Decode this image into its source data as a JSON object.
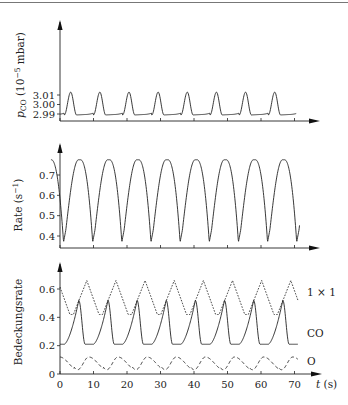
{
  "chart_data": [
    {
      "type": "line",
      "panel": "top",
      "title": "",
      "ylabel": "p_CO (10^-5 mbar)",
      "ylabel_parts": {
        "main": "p",
        "sub": "CO",
        "unit_pre": " (10",
        "sup": "−5",
        "unit_post": " mbar)"
      },
      "xlabel": "",
      "yticks": [
        2.99,
        3.0,
        3.01
      ],
      "ytick_labels": [
        "2.99",
        "3.00",
        "3.01"
      ],
      "ylim": [
        2.986,
        3.025
      ],
      "xlim": [
        0,
        77
      ],
      "grid": false,
      "series": [
        {
          "name": "p_CO",
          "style": "solid",
          "period": 8.7,
          "phase_peak": 3.2,
          "min": 2.989,
          "max": 3.013,
          "t_start": 0.0,
          "t_end": 70.5,
          "shape": "pressure"
        }
      ]
    },
    {
      "type": "line",
      "panel": "middle",
      "ylabel": "Rate (s^-1)",
      "ylabel_parts": {
        "main": "Rate (s",
        "sup": "−1",
        "post": ")"
      },
      "xlabel": "",
      "yticks": [
        0.4,
        0.5,
        0.6,
        0.7
      ],
      "ytick_labels": [
        "0.4",
        "0.5",
        "0.6",
        "0.7"
      ],
      "ylim": [
        0.34,
        0.8
      ],
      "xlim": [
        0,
        77
      ],
      "grid": false,
      "series": [
        {
          "name": "Rate",
          "style": "solid",
          "period": 8.7,
          "phase_peak": 6.1,
          "min": 0.37,
          "max": 0.775,
          "t_start": -2.7,
          "t_end": 71.5,
          "shape": "rate"
        }
      ]
    },
    {
      "type": "line",
      "panel": "bottom",
      "ylabel": "Bedeckungsrate",
      "xlabel": "t (s)",
      "xticks": [
        0,
        10,
        20,
        30,
        40,
        50,
        60,
        70
      ],
      "xtick_labels": [
        "0",
        "10",
        "20",
        "30",
        "40",
        "50",
        "60",
        "70"
      ],
      "yticks": [
        0,
        0.2,
        0.4,
        0.6
      ],
      "ytick_labels": [
        "0",
        "0.2",
        "0.4",
        "0.6"
      ],
      "ylim": [
        0,
        0.72
      ],
      "xlim": [
        0,
        77
      ],
      "grid": false,
      "legend_position": "right-inline",
      "series": [
        {
          "name": "1 × 1",
          "style": "dotted",
          "period": 8.7,
          "phase_peak": 8.0,
          "min": 0.42,
          "max": 0.66,
          "t_start": 0.0,
          "t_end": 71.0,
          "shape": "surface"
        },
        {
          "name": "CO",
          "style": "solid",
          "period": 8.7,
          "phase_peak": 5.6,
          "min": 0.21,
          "max": 0.52,
          "t_start": 0.0,
          "t_end": 71.0,
          "shape": "co"
        },
        {
          "name": "O",
          "style": "dashed",
          "period": 8.7,
          "phase_peak": 8.6,
          "min": 0.03,
          "max": 0.12,
          "t_start": 0.0,
          "t_end": 71.0,
          "shape": "oxygen"
        }
      ],
      "labels": {
        "surface": "1 × 1",
        "co": "CO",
        "oxygen": "O"
      }
    }
  ],
  "axes": {
    "x_unit_label_t": "t",
    "x_unit_label_s": " (s)"
  }
}
